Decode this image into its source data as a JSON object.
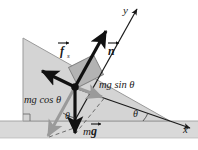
{
  "figure": {
    "type": "physics-force-diagram",
    "canvas": {
      "width": 198,
      "height": 150
    },
    "background_color": "#ffffff"
  },
  "colors": {
    "incline_fill": "#d4d4d4",
    "incline_stroke": "#8c8c8c",
    "ground_fill": "#d9d9d9",
    "ground_stroke": "#a8a8a8",
    "block_fill": "#b0b0b0",
    "block_stroke": "#7a7a7a",
    "axis_stroke": "#1a1a1a",
    "vector_black": "#111111",
    "vector_gray": "#9a9a9a",
    "dashed_gray": "#6e6e6e",
    "text": "#1a1a1a"
  },
  "axes": [
    {
      "name": "y-axis",
      "label": "y",
      "label_pos": {
        "x": 125,
        "y": 13
      },
      "line": {
        "x1": 76,
        "y1": 121,
        "x2": 137,
        "y2": 9
      }
    },
    {
      "name": "x-axis",
      "label": "x",
      "label_pos": {
        "x": 185,
        "y": 131
      },
      "line": {
        "x1": 74,
        "y1": 88,
        "x2": 190,
        "y2": 128
      }
    }
  ],
  "incline": {
    "name": "inclined-plane",
    "apex": {
      "x": 23,
      "y": 38
    },
    "bottom_left": {
      "x": 23,
      "y": 121
    },
    "bottom_right": {
      "x": 170,
      "y": 121
    },
    "right_angle_marker": true
  },
  "ground": {
    "name": "ground-strip",
    "y_top": 121,
    "height": 17
  },
  "block": {
    "name": "block-on-incline",
    "center": {
      "x": 85,
      "y": 72
    },
    "width": 28,
    "height": 20,
    "rotation_deg": -27
  },
  "origin_dot": {
    "x": 75,
    "y": 87,
    "r": 3.6
  },
  "vectors": [
    {
      "name": "normal-force-vector",
      "label": "n",
      "label_display": "n",
      "has_vector_arrow": true,
      "bold": true,
      "color_key": "vector_black",
      "label_pos": {
        "x": 112,
        "y": 53
      },
      "from": {
        "x": 75,
        "y": 87
      },
      "to": {
        "x": 107,
        "y": 29
      }
    },
    {
      "name": "friction-force-vector",
      "label": "f",
      "label_display": "f",
      "subscript": "s",
      "has_vector_arrow": true,
      "bold": true,
      "color_key": "vector_black",
      "label_pos": {
        "x": 60,
        "y": 53
      },
      "from": {
        "x": 75,
        "y": 87
      },
      "to": {
        "x": 40,
        "y": 70
      }
    },
    {
      "name": "weight-force-vector",
      "label": "mg",
      "label_display": "mg",
      "has_vector_arrow": true,
      "bold_part": "g",
      "color_key": "vector_black",
      "label_pos": {
        "x": 93,
        "y": 133
      },
      "from": {
        "x": 75,
        "y": 87
      },
      "to": {
        "x": 75,
        "y": 135
      }
    },
    {
      "name": "mg-sin-theta-component-vector",
      "label": "mg sin θ",
      "color_key": "vector_gray",
      "label_pos": {
        "x": 101,
        "y": 86
      },
      "from": {
        "x": 75,
        "y": 87
      },
      "to": {
        "x": 103,
        "y": 98
      }
    },
    {
      "name": "mg-cos-theta-component-vector",
      "label": "mg cos θ",
      "color_key": "vector_gray",
      "label_pos": {
        "x": 28,
        "y": 101
      },
      "from": {
        "x": 75,
        "y": 87
      },
      "to": {
        "x": 47,
        "y": 137
      }
    }
  ],
  "dashed_lines": [
    {
      "name": "dashed-projection-right",
      "x1": 75,
      "y1": 135,
      "x2": 107,
      "y2": 98
    },
    {
      "name": "dashed-projection-left",
      "x1": 47,
      "y1": 137,
      "x2": 76,
      "y2": 126
    }
  ],
  "angles": [
    {
      "name": "angle-theta-at-block",
      "label": "θ",
      "label_pos": {
        "x": 70,
        "y": 116
      },
      "vertex": {
        "x": 75,
        "y": 87
      }
    },
    {
      "name": "angle-theta-at-incline-base",
      "label": "θ",
      "label_pos": {
        "x": 135,
        "y": 113
      },
      "vertex": {
        "x": 170,
        "y": 121
      }
    }
  ],
  "labels": {
    "y_axis": "y",
    "x_axis": "x",
    "normal": "n",
    "friction": "f",
    "friction_subscript": "s",
    "weight_m": "m",
    "weight_g": "g",
    "mg_sin": "mg sin θ",
    "mg_cos": "mg cos θ",
    "theta": "θ"
  }
}
